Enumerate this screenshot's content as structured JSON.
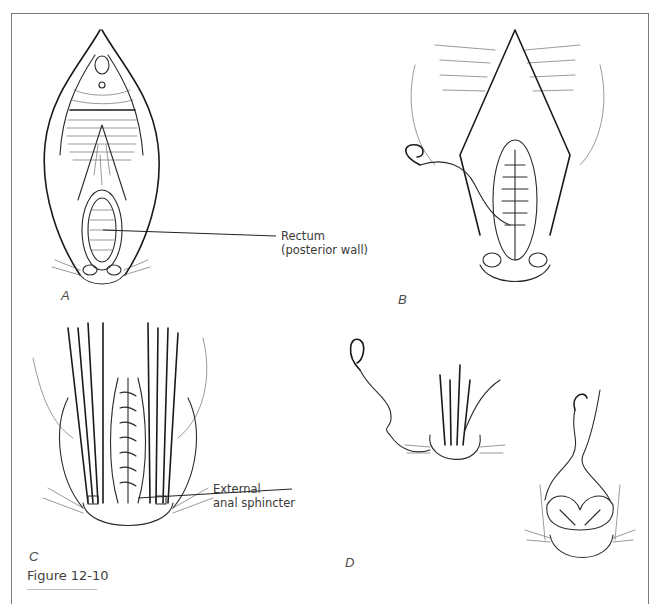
{
  "figure": {
    "caption": "Figure 12-10",
    "panels": [
      {
        "letter": "A",
        "description": "Exposure of the rectovaginal septum through a midline incision with labial retraction",
        "callouts": [
          {
            "line1": "Rectum",
            "line2": "(posterior wall)"
          }
        ]
      },
      {
        "letter": "B",
        "description": "Closure of the anterior rectal wall with interrupted sutures on a curved needle",
        "callouts": []
      },
      {
        "letter": "C",
        "description": "Allis clamps grasping the retracted ends of the sphincter over the repaired rectal wall",
        "callouts": [
          {
            "line1": "External",
            "line2": "anal sphincter"
          }
        ]
      },
      {
        "letter": "D",
        "description": "Suturing and approximation of the external anal sphincter ends",
        "callouts": []
      }
    ]
  },
  "colors": {
    "ink": "#2a2a2a",
    "frame": "#7a7a7a",
    "label": "#3a3a3a",
    "background": "#ffffff"
  }
}
